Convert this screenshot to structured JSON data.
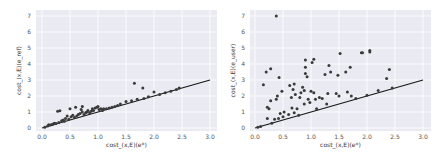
{
  "chart_data": [
    {
      "type": "scatter",
      "title": "",
      "xlabel": "cost_(x,E)(e*)",
      "ylabel": "cost_(x,E)(e_ref)",
      "xlim": [
        -0.1,
        3.05
      ],
      "ylim": [
        -0.2,
        7.3
      ],
      "xticks": [
        "0.0",
        "0.5",
        "1.0",
        "1.5",
        "2.0",
        "2.5",
        "3.0"
      ],
      "yticks": [
        "0",
        "1",
        "2",
        "3",
        "4",
        "5",
        "6",
        "7"
      ],
      "grid": true,
      "reference_line": {
        "x": [
          0,
          3
        ],
        "y": [
          0,
          3
        ],
        "label": "y = x"
      },
      "marker_color": "#3a3a3a",
      "points": [
        [
          0.05,
          0.05
        ],
        [
          0.1,
          0.12
        ],
        [
          0.12,
          0.2
        ],
        [
          0.15,
          0.18
        ],
        [
          0.18,
          0.22
        ],
        [
          0.2,
          0.25
        ],
        [
          0.22,
          0.3
        ],
        [
          0.25,
          0.28
        ],
        [
          0.28,
          1.05
        ],
        [
          0.32,
          1.08
        ],
        [
          0.3,
          0.35
        ],
        [
          0.35,
          0.45
        ],
        [
          0.38,
          0.5
        ],
        [
          0.4,
          0.42
        ],
        [
          0.42,
          0.6
        ],
        [
          0.45,
          0.75
        ],
        [
          0.48,
          0.55
        ],
        [
          0.5,
          1.2
        ],
        [
          0.52,
          0.7
        ],
        [
          0.55,
          0.8
        ],
        [
          0.58,
          0.65
        ],
        [
          0.6,
          1.3
        ],
        [
          0.62,
          0.75
        ],
        [
          0.65,
          0.85
        ],
        [
          0.68,
          0.9
        ],
        [
          0.7,
          1.15
        ],
        [
          0.72,
          1.35
        ],
        [
          0.72,
          1.0
        ],
        [
          0.75,
          0.85
        ],
        [
          0.78,
          0.95
        ],
        [
          0.8,
          1.0
        ],
        [
          0.82,
          1.1
        ],
        [
          0.85,
          0.95
        ],
        [
          0.88,
          1.05
        ],
        [
          0.9,
          1.2
        ],
        [
          0.92,
          1.1
        ],
        [
          0.95,
          1.25
        ],
        [
          0.98,
          1.3
        ],
        [
          1.0,
          1.35
        ],
        [
          1.02,
          1.15
        ],
        [
          1.05,
          1.2
        ],
        [
          1.08,
          1.1
        ],
        [
          1.1,
          1.2
        ],
        [
          1.15,
          1.2
        ],
        [
          1.2,
          1.25
        ],
        [
          1.25,
          1.3
        ],
        [
          1.3,
          1.35
        ],
        [
          1.35,
          1.4
        ],
        [
          1.4,
          1.5
        ],
        [
          1.5,
          1.65
        ],
        [
          1.6,
          1.7
        ],
        [
          1.65,
          2.8
        ],
        [
          1.7,
          1.8
        ],
        [
          1.8,
          2.5
        ],
        [
          1.82,
          1.85
        ],
        [
          1.9,
          1.95
        ],
        [
          2.0,
          2.25
        ],
        [
          2.1,
          2.1
        ],
        [
          2.2,
          2.2
        ],
        [
          2.3,
          2.3
        ],
        [
          2.4,
          2.4
        ],
        [
          2.45,
          2.5
        ]
      ]
    },
    {
      "type": "scatter",
      "title": "",
      "xlabel": "cost_(x,E)(e*)",
      "ylabel": "cost_(x,E)(e_user)",
      "xlim": [
        -0.1,
        3.05
      ],
      "ylim": [
        -0.2,
        7.3
      ],
      "xticks": [
        "0.0",
        "0.5",
        "1.0",
        "1.5",
        "2.0",
        "2.5",
        "3.0"
      ],
      "yticks": [
        "0",
        "1",
        "2",
        "3",
        "4",
        "5",
        "6",
        "7"
      ],
      "grid": true,
      "reference_line": {
        "x": [
          0,
          3
        ],
        "y": [
          0,
          3
        ],
        "label": "y = x"
      },
      "marker_color": "#3a3a3a",
      "points": [
        [
          0.05,
          0.05
        ],
        [
          0.1,
          0.1
        ],
        [
          0.15,
          2.7
        ],
        [
          0.2,
          3.5
        ],
        [
          0.22,
          0.6
        ],
        [
          0.22,
          1.3
        ],
        [
          0.25,
          1.2
        ],
        [
          0.28,
          3.7
        ],
        [
          0.28,
          1.7
        ],
        [
          0.3,
          0.3
        ],
        [
          0.35,
          0.55
        ],
        [
          0.38,
          1.8
        ],
        [
          0.38,
          7.0
        ],
        [
          0.4,
          2.0
        ],
        [
          0.42,
          0.6
        ],
        [
          0.43,
          3.15
        ],
        [
          0.45,
          0.9
        ],
        [
          0.48,
          2.3
        ],
        [
          0.5,
          0.7
        ],
        [
          0.52,
          1.0
        ],
        [
          0.6,
          0.85
        ],
        [
          0.62,
          2.65
        ],
        [
          0.65,
          1.9
        ],
        [
          0.66,
          1.25
        ],
        [
          0.68,
          2.4
        ],
        [
          0.7,
          2.75
        ],
        [
          0.7,
          0.95
        ],
        [
          0.72,
          2.1
        ],
        [
          0.75,
          1.2
        ],
        [
          0.78,
          0.8
        ],
        [
          0.8,
          1.9
        ],
        [
          0.82,
          2.2
        ],
        [
          0.85,
          2.55
        ],
        [
          0.88,
          1.5
        ],
        [
          0.88,
          2.35
        ],
        [
          0.9,
          4.25
        ],
        [
          0.9,
          3.8
        ],
        [
          0.9,
          3.4
        ],
        [
          0.93,
          3.2
        ],
        [
          0.95,
          1.8
        ],
        [
          0.98,
          1.6
        ],
        [
          1.0,
          2.3
        ],
        [
          1.02,
          4.1
        ],
        [
          1.05,
          4.3
        ],
        [
          1.05,
          2.2
        ],
        [
          1.08,
          1.8
        ],
        [
          1.1,
          1.2
        ],
        [
          1.15,
          1.9
        ],
        [
          1.2,
          1.85
        ],
        [
          1.25,
          3.35
        ],
        [
          1.28,
          1.5
        ],
        [
          1.3,
          2.15
        ],
        [
          1.32,
          3.9
        ],
        [
          1.35,
          3.5
        ],
        [
          1.45,
          2.15
        ],
        [
          1.48,
          3.3
        ],
        [
          1.5,
          2.0
        ],
        [
          1.52,
          4.65
        ],
        [
          1.62,
          3.5
        ],
        [
          1.65,
          2.25
        ],
        [
          1.7,
          3.8
        ],
        [
          1.72,
          2.0
        ],
        [
          1.8,
          1.85
        ],
        [
          1.9,
          4.7
        ],
        [
          1.92,
          4.7
        ],
        [
          2.0,
          2.05
        ],
        [
          2.05,
          4.85
        ],
        [
          2.05,
          4.75
        ],
        [
          2.2,
          2.35
        ],
        [
          2.35,
          3.1
        ],
        [
          2.4,
          3.65
        ],
        [
          2.45,
          2.5
        ]
      ]
    }
  ]
}
